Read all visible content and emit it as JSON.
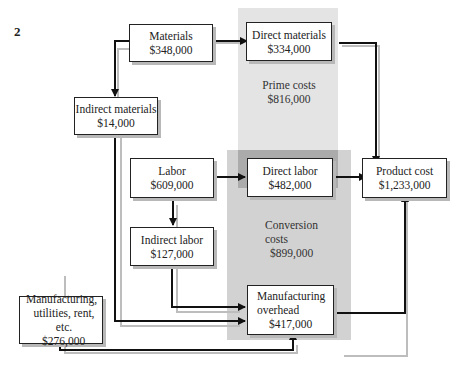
{
  "figure_number": "2",
  "nodes": {
    "materials": {
      "title": "Materials",
      "value": "$348,000"
    },
    "direct_materials": {
      "title": "Direct materials",
      "value": "$334,000"
    },
    "indirect_materials": {
      "title": "Indirect materials",
      "value": "$14,000"
    },
    "labor": {
      "title": "Labor",
      "value": "$609,000"
    },
    "direct_labor": {
      "title": "Direct labor",
      "value": "$482,000"
    },
    "indirect_labor": {
      "title": "Indirect labor",
      "value": "$127,000"
    },
    "mfg_utilities": {
      "line1": "Manufacturing,",
      "line2": "utilities, rent, etc.",
      "value": "$276,000"
    },
    "mfg_overhead": {
      "line1": "Manufacturing",
      "line2": "overhead",
      "value": "$417,000"
    },
    "product_cost": {
      "title": "Product cost",
      "value": "$1,233,000"
    }
  },
  "regions": {
    "prime_costs": {
      "title": "Prime costs",
      "value": "$816,000"
    },
    "conversion_costs": {
      "line1": "Conversion",
      "line2": "costs",
      "value": "$899,000"
    }
  },
  "colors": {
    "prime_region": "#e2e2e2",
    "conversion_region": "#cfcfcf",
    "overlap": "#a8a8a8",
    "arrow": "#111111",
    "shadow": "#b8b8b8"
  }
}
